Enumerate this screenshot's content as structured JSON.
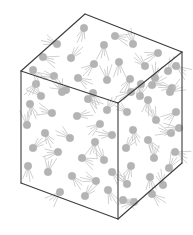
{
  "figure": {
    "background_color": "#ffffff",
    "edge_color": "#3c3c3c",
    "particle_color": "#b4b4b4",
    "trail_color": "#c2c2c2",
    "canvas": {
      "width": 193,
      "height": 235
    }
  },
  "cube": {
    "projection": "isometric",
    "vertices": {
      "top_back": [
        85,
        14
      ],
      "top_left": [
        21,
        71
      ],
      "top_right": [
        182,
        52
      ],
      "center_front_top": [
        118,
        103
      ],
      "bottom_left": [
        21,
        183
      ],
      "bottom_right": [
        182,
        163
      ],
      "bottom_front": [
        118,
        219
      ]
    },
    "edges": [
      {
        "name": "top-back-to-top-left",
        "from": [
          85,
          14
        ],
        "to": [
          21,
          71
        ]
      },
      {
        "name": "top-back-to-top-right",
        "from": [
          85,
          14
        ],
        "to": [
          182,
          52
        ]
      },
      {
        "name": "top-left-to-center",
        "from": [
          21,
          71
        ],
        "to": [
          118,
          103
        ]
      },
      {
        "name": "top-right-to-center",
        "from": [
          182,
          52
        ],
        "to": [
          118,
          103
        ]
      },
      {
        "name": "left-vertical",
        "from": [
          21,
          71
        ],
        "to": [
          21,
          183
        ]
      },
      {
        "name": "right-vertical",
        "from": [
          182,
          52
        ],
        "to": [
          182,
          163
        ]
      },
      {
        "name": "center-vertical",
        "from": [
          118,
          103
        ],
        "to": [
          118,
          219
        ]
      },
      {
        "name": "bottom-left-to-front",
        "from": [
          21,
          183
        ],
        "to": [
          118,
          219
        ]
      },
      {
        "name": "bottom-right-to-front",
        "from": [
          182,
          163
        ],
        "to": [
          118,
          219
        ]
      }
    ],
    "faces": [
      {
        "name": "top-face",
        "points": "85,14 182,52 118,103 21,71"
      },
      {
        "name": "left-face",
        "points": "21,71 118,103 118,219 21,183"
      },
      {
        "name": "right-face",
        "points": "118,103 182,52 182,163 118,219"
      }
    ]
  },
  "particles": {
    "count": 72,
    "radius": 3.8,
    "trails_per_particle": 4,
    "top_face": [
      {
        "x": 84,
        "y": 28,
        "angle": 108
      },
      {
        "x": 57,
        "y": 44,
        "angle": 200
      },
      {
        "x": 104,
        "y": 45,
        "angle": 95
      },
      {
        "x": 133,
        "y": 44,
        "angle": 255
      },
      {
        "x": 158,
        "y": 53,
        "angle": 160
      },
      {
        "x": 43,
        "y": 57,
        "angle": 20
      },
      {
        "x": 71,
        "y": 58,
        "angle": 310
      },
      {
        "x": 94,
        "y": 64,
        "angle": 140
      },
      {
        "x": 119,
        "y": 62,
        "angle": 88
      },
      {
        "x": 145,
        "y": 66,
        "angle": 225
      },
      {
        "x": 168,
        "y": 71,
        "angle": 300
      },
      {
        "x": 33,
        "y": 70,
        "angle": 55
      },
      {
        "x": 54,
        "y": 76,
        "angle": 185
      },
      {
        "x": 78,
        "y": 78,
        "angle": 30
      },
      {
        "x": 107,
        "y": 80,
        "angle": 265
      },
      {
        "x": 130,
        "y": 79,
        "angle": 120
      },
      {
        "x": 152,
        "y": 85,
        "angle": 340
      },
      {
        "x": 66,
        "y": 90,
        "angle": 210
      },
      {
        "x": 93,
        "y": 93,
        "angle": 70
      },
      {
        "x": 140,
        "y": 96,
        "angle": 285
      },
      {
        "x": 115,
        "y": 36,
        "angle": 15
      },
      {
        "x": 172,
        "y": 88,
        "angle": 190
      }
    ],
    "left_face": [
      {
        "x": 36,
        "y": 84,
        "angle": 130
      },
      {
        "x": 62,
        "y": 92,
        "angle": 250
      },
      {
        "x": 88,
        "y": 99,
        "angle": 40
      },
      {
        "x": 107,
        "y": 110,
        "angle": 300
      },
      {
        "x": 30,
        "y": 104,
        "angle": 75
      },
      {
        "x": 52,
        "y": 113,
        "angle": 195
      },
      {
        "x": 77,
        "y": 116,
        "angle": 350
      },
      {
        "x": 100,
        "y": 124,
        "angle": 145
      },
      {
        "x": 27,
        "y": 125,
        "angle": 265
      },
      {
        "x": 45,
        "y": 133,
        "angle": 60
      },
      {
        "x": 70,
        "y": 138,
        "angle": 215
      },
      {
        "x": 95,
        "y": 142,
        "angle": 105
      },
      {
        "x": 33,
        "y": 148,
        "angle": 320
      },
      {
        "x": 58,
        "y": 152,
        "angle": 170
      },
      {
        "x": 82,
        "y": 158,
        "angle": 25
      },
      {
        "x": 104,
        "y": 160,
        "angle": 240
      },
      {
        "x": 28,
        "y": 166,
        "angle": 90
      },
      {
        "x": 48,
        "y": 172,
        "angle": 280
      },
      {
        "x": 72,
        "y": 176,
        "angle": 50
      },
      {
        "x": 96,
        "y": 181,
        "angle": 200
      },
      {
        "x": 60,
        "y": 192,
        "angle": 135
      },
      {
        "x": 85,
        "y": 196,
        "angle": 310
      },
      {
        "x": 108,
        "y": 190,
        "angle": 65
      },
      {
        "x": 41,
        "y": 96,
        "angle": 225
      },
      {
        "x": 112,
        "y": 135,
        "angle": 185
      },
      {
        "x": 112,
        "y": 172,
        "angle": 45
      }
    ],
    "right_face": [
      {
        "x": 131,
        "y": 92,
        "angle": 155
      },
      {
        "x": 155,
        "y": 78,
        "angle": 280
      },
      {
        "x": 176,
        "y": 66,
        "angle": 35
      },
      {
        "x": 127,
        "y": 112,
        "angle": 215
      },
      {
        "x": 148,
        "y": 100,
        "angle": 95
      },
      {
        "x": 170,
        "y": 92,
        "angle": 330
      },
      {
        "x": 133,
        "y": 130,
        "angle": 70
      },
      {
        "x": 156,
        "y": 120,
        "angle": 245
      },
      {
        "x": 176,
        "y": 112,
        "angle": 140
      },
      {
        "x": 126,
        "y": 148,
        "angle": 305
      },
      {
        "x": 148,
        "y": 140,
        "angle": 55
      },
      {
        "x": 171,
        "y": 133,
        "angle": 195
      },
      {
        "x": 131,
        "y": 166,
        "angle": 110
      },
      {
        "x": 154,
        "y": 158,
        "angle": 270
      },
      {
        "x": 175,
        "y": 152,
        "angle": 20
      },
      {
        "x": 127,
        "y": 184,
        "angle": 230
      },
      {
        "x": 150,
        "y": 177,
        "angle": 85
      },
      {
        "x": 169,
        "y": 168,
        "angle": 300
      },
      {
        "x": 134,
        "y": 202,
        "angle": 165
      },
      {
        "x": 152,
        "y": 194,
        "angle": 40
      },
      {
        "x": 141,
        "y": 84,
        "angle": 125
      },
      {
        "x": 163,
        "y": 185,
        "angle": 255
      },
      {
        "x": 123,
        "y": 200,
        "angle": 15
      },
      {
        "x": 179,
        "y": 128,
        "angle": 175
      }
    ]
  }
}
